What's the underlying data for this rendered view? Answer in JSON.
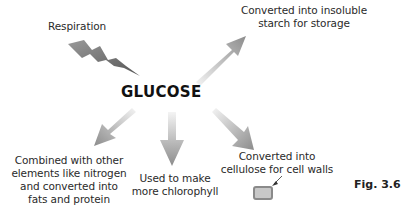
{
  "diagram": {
    "center_label": "GLUCOSE",
    "figure_label": "Fig. 3.6",
    "nodes": [
      {
        "id": "respiration",
        "label": "Respiration",
        "arrow": "lightning-arrow-inward"
      },
      {
        "id": "starch",
        "label_lines": [
          "Converted into insoluble",
          "starch for storage"
        ],
        "arrow": "up-right"
      },
      {
        "id": "fats",
        "label_lines": [
          "Combined with other",
          "elements like nitrogen",
          "and converted into",
          "fats and protein"
        ],
        "arrow": "down-left"
      },
      {
        "id": "chlorophyll",
        "label_lines": [
          "Used to make",
          "more chlorophyll"
        ],
        "arrow": "down"
      },
      {
        "id": "cellulose",
        "label_lines": [
          "Converted into",
          "cellulose for cell walls"
        ],
        "arrow": "down-right"
      }
    ],
    "colors": {
      "arrow_dark": "#8c8c8c",
      "arrow_light": "#f2f2f2",
      "cell_fill": "#c8c8c8",
      "cell_border": "#8a8a8a"
    }
  }
}
